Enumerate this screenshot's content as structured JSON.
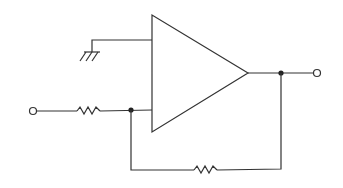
{
  "diagram": {
    "type": "circuit-schematic",
    "colors": {
      "line": "#333333",
      "background": "#ffffff"
    },
    "components": [
      {
        "id": "op-amp",
        "kind": "operational-amplifier"
      },
      {
        "id": "r-in",
        "kind": "resistor"
      },
      {
        "id": "r-feedback",
        "kind": "resistor"
      },
      {
        "id": "ground",
        "kind": "ground"
      },
      {
        "id": "input-terminal",
        "kind": "terminal"
      },
      {
        "id": "output-terminal",
        "kind": "terminal"
      },
      {
        "id": "junction-input",
        "kind": "junction"
      },
      {
        "id": "junction-output",
        "kind": "junction"
      }
    ]
  }
}
